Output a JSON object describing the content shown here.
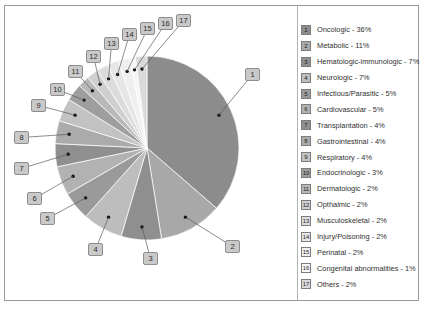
{
  "chart_data": {
    "type": "pie",
    "title": "",
    "legend_position": "right",
    "start_angle_deg": 0,
    "direction": "clockwise",
    "unit": "%",
    "categories": [
      "Oncologic",
      "Metabolic",
      "Hematologic-immunologic",
      "Neurologic",
      "Infectious/Parasitic",
      "Cardiovascular",
      "Transplantation",
      "Gastrointestinal",
      "Respiratory",
      "Endocrinologic",
      "Dermatologic",
      "Opthalmic",
      "Musculoskeletal",
      "Injury/Poisoning",
      "Perinatal",
      "Congenital abnormalities",
      "Others"
    ],
    "values": [
      36,
      11,
      7,
      7,
      5,
      5,
      4,
      4,
      4,
      3,
      2,
      2,
      2,
      2,
      2,
      1,
      2
    ],
    "slice_colors": [
      "#8c8c8c",
      "#a8a8a8",
      "#8f8f8f",
      "#bdbdbd",
      "#9a9a9a",
      "#b2b2b2",
      "#8f8f8f",
      "#ababab",
      "#c2c2c2",
      "#9e9e9e",
      "#b8b8b8",
      "#cfcfcf",
      "#dcdcdc",
      "#e6e6e6",
      "#efefef",
      "#f6f6f6",
      "#dadada"
    ]
  },
  "legend": {
    "items": [
      {
        "n": "1",
        "label": "Oncologic - 36%"
      },
      {
        "n": "2",
        "label": "Metabolic - 11%"
      },
      {
        "n": "3",
        "label": "Hematologic-immunologic - 7%"
      },
      {
        "n": "4",
        "label": "Neurologic - 7%"
      },
      {
        "n": "5",
        "label": "Infectious/Parasitic - 5%"
      },
      {
        "n": "6",
        "label": "Cardiovascular - 5%"
      },
      {
        "n": "7",
        "label": "Transplantation - 4%"
      },
      {
        "n": "8",
        "label": "Gastrointestinal - 4%"
      },
      {
        "n": "9",
        "label": "Respiratory - 4%"
      },
      {
        "n": "10",
        "label": "Endocrinologic - 3%"
      },
      {
        "n": "11",
        "label": "Dermatologic - 2%"
      },
      {
        "n": "12",
        "label": "Opthalmic - 2%"
      },
      {
        "n": "13",
        "label": "Musculoskeletal - 2%"
      },
      {
        "n": "14",
        "label": "Injury/Poisoning - 2%"
      },
      {
        "n": "15",
        "label": "Perinatal - 2%"
      },
      {
        "n": "16",
        "label": "Congenital abnormalities - 1%"
      },
      {
        "n": "17",
        "label": "Others - 2%"
      }
    ]
  },
  "callouts": [
    {
      "n": "1",
      "x": 245,
      "y": 68
    },
    {
      "n": "2",
      "x": 225,
      "y": 240
    },
    {
      "n": "3",
      "x": 143,
      "y": 252
    },
    {
      "n": "4",
      "x": 88,
      "y": 243
    },
    {
      "n": "5",
      "x": 40,
      "y": 212
    },
    {
      "n": "6",
      "x": 27,
      "y": 192
    },
    {
      "n": "7",
      "x": 14,
      "y": 162
    },
    {
      "n": "8",
      "x": 14,
      "y": 131
    },
    {
      "n": "9",
      "x": 31,
      "y": 99
    },
    {
      "n": "10",
      "x": 50,
      "y": 83
    },
    {
      "n": "11",
      "x": 68,
      "y": 65
    },
    {
      "n": "12",
      "x": 86,
      "y": 50
    },
    {
      "n": "13",
      "x": 104,
      "y": 37
    },
    {
      "n": "14",
      "x": 122,
      "y": 28
    },
    {
      "n": "15",
      "x": 140,
      "y": 22
    },
    {
      "n": "16",
      "x": 158,
      "y": 17
    },
    {
      "n": "17",
      "x": 176,
      "y": 14
    }
  ]
}
